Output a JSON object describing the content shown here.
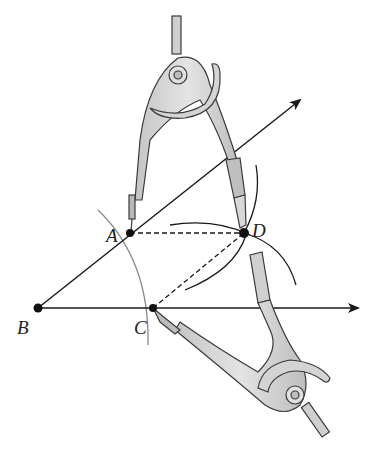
{
  "diagram": {
    "points": {
      "A": {
        "label": "A",
        "x": 130,
        "y": 233
      },
      "B": {
        "label": "B",
        "x": 38,
        "y": 308
      },
      "C": {
        "label": "C",
        "x": 153,
        "y": 308
      },
      "D": {
        "label": "D",
        "x": 244,
        "y": 233
      }
    },
    "rays": [
      {
        "from": "B",
        "through": "A",
        "end": [
          302,
          98
        ]
      },
      {
        "from": "B",
        "through": "C",
        "end": [
          360,
          308
        ]
      }
    ],
    "dashed_segments": [
      {
        "from": "A",
        "to": "D"
      },
      {
        "from": "C",
        "to": "D"
      }
    ],
    "tools": [
      "compass-top",
      "compass-bottom"
    ],
    "colors": {
      "line": "#1a1a1a",
      "arc_light": "#8a8a8a",
      "compass_fill": "#d6d6d6",
      "compass_stroke": "#3a3a3a"
    }
  }
}
